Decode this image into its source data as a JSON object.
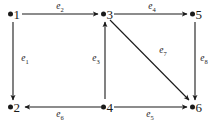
{
  "figure": {
    "kind": "directed-graph",
    "background_color": "#ffffff",
    "ink_color": "#1a1a1a",
    "width": 220,
    "height": 122
  },
  "nodes": [
    {
      "id": "1",
      "label": "1",
      "x": 12,
      "y": 14,
      "dot": "filled-circle"
    },
    {
      "id": "2",
      "label": "2",
      "x": 12,
      "y": 107,
      "dot": "filled-circle"
    },
    {
      "id": "3",
      "label": "3",
      "x": 105,
      "y": 14,
      "dot": "filled-circle"
    },
    {
      "id": "4",
      "label": "4",
      "x": 105,
      "y": 107,
      "dot": "filled-circle"
    },
    {
      "id": "5",
      "label": "5",
      "x": 194,
      "y": 14,
      "dot": "filled-circle"
    },
    {
      "id": "6",
      "label": "6",
      "x": 194,
      "y": 107,
      "dot": "filled-circle"
    }
  ],
  "edges": [
    {
      "id": "e1",
      "label": "e",
      "sub": "1",
      "from": "1",
      "to": "2",
      "direction": "down",
      "label_x": 25,
      "label_y": 60
    },
    {
      "id": "e2",
      "label": "e",
      "sub": "2",
      "from": "1",
      "to": "3",
      "direction": "right",
      "label_x": 60,
      "label_y": 8
    },
    {
      "id": "e3",
      "label": "e",
      "sub": "3",
      "from": "4",
      "to": "3",
      "direction": "up",
      "label_x": 96,
      "label_y": 60
    },
    {
      "id": "e4",
      "label": "e",
      "sub": "4",
      "from": "3",
      "to": "5",
      "direction": "right",
      "label_x": 152,
      "label_y": 8
    },
    {
      "id": "e5",
      "label": "e",
      "sub": "5",
      "from": "4",
      "to": "6",
      "direction": "right",
      "label_x": 150,
      "label_y": 116
    },
    {
      "id": "e6",
      "label": "e",
      "sub": "6",
      "from": "4",
      "to": "2",
      "direction": "left",
      "label_x": 60,
      "label_y": 116
    },
    {
      "id": "e7",
      "label": "e",
      "sub": "7",
      "from": "3",
      "to": "6",
      "direction": "diagonal-down-right",
      "label_x": 163,
      "label_y": 52
    },
    {
      "id": "e8",
      "label": "e",
      "sub": "8",
      "from": "5",
      "to": "6",
      "direction": "down",
      "label_x": 204,
      "label_y": 60
    }
  ]
}
